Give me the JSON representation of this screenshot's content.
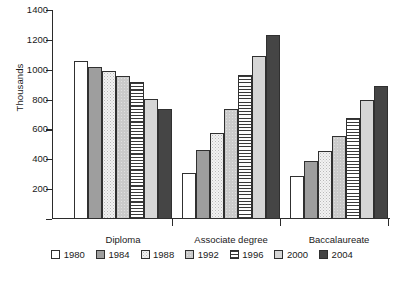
{
  "chart_data": {
    "type": "bar",
    "title": "",
    "subtitle": "",
    "xlabel": "",
    "ylabel": "Thousands",
    "categories": [
      "Diploma",
      "Associate degree",
      "Baccalaureate"
    ],
    "ylim": [
      0,
      1400
    ],
    "yticks": [
      0,
      200,
      400,
      600,
      800,
      1000,
      1200,
      1400
    ],
    "ytick_labels": [
      "",
      "200",
      "400",
      "600",
      "800",
      "1000",
      "1200",
      "1400"
    ],
    "grid": false,
    "legend_position": "bottom",
    "series": [
      {
        "name": "1980",
        "values": [
          1060,
          310,
          290
        ],
        "swatch": "p-white"
      },
      {
        "name": "1984",
        "values": [
          1020,
          460,
          390
        ],
        "swatch": "p-midgray"
      },
      {
        "name": "1988",
        "values": [
          990,
          575,
          455
        ],
        "swatch": "p-dots"
      },
      {
        "name": "1992",
        "values": [
          955,
          740,
          555
        ],
        "swatch": "p-lightgray-dots"
      },
      {
        "name": "1996",
        "values": [
          915,
          965,
          680
        ],
        "swatch": "p-hstripe"
      },
      {
        "name": "2000",
        "values": [
          805,
          1095,
          795
        ],
        "swatch": "p-palegray"
      },
      {
        "name": "2004",
        "values": [
          740,
          1230,
          890
        ],
        "swatch": "p-dark"
      }
    ]
  },
  "legend": {
    "items": [
      {
        "label": "1980"
      },
      {
        "label": "1984"
      },
      {
        "label": "1988"
      },
      {
        "label": "1992"
      },
      {
        "label": "1996"
      },
      {
        "label": "2000"
      },
      {
        "label": "2004"
      }
    ]
  },
  "colors": {
    "axis": "#2b2b2b",
    "bar_outline": "#303030",
    "background": "#ffffff",
    "text": "#1a1a1a"
  }
}
